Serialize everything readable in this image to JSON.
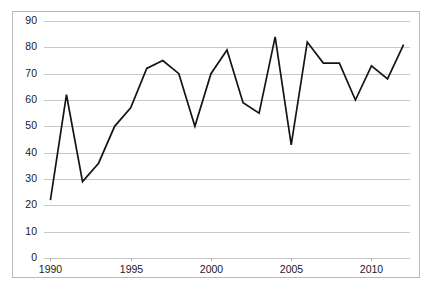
{
  "chart_data": {
    "type": "line",
    "title": "",
    "subtitle": "",
    "xlabel": "",
    "ylabel": "",
    "x": [
      1990,
      1991,
      1992,
      1993,
      1994,
      1995,
      1996,
      1997,
      1998,
      1999,
      2000,
      2001,
      2002,
      2003,
      2004,
      2005,
      2006,
      2007,
      2008,
      2009,
      2010,
      2011,
      2012
    ],
    "values": [
      22,
      62,
      29,
      36,
      50,
      57,
      72,
      75,
      70,
      50,
      70,
      79,
      59,
      55,
      84,
      43,
      82,
      74,
      74,
      60,
      73,
      68,
      81
    ],
    "series": [
      {
        "name": "",
        "values": [
          22,
          62,
          29,
          36,
          50,
          57,
          72,
          75,
          70,
          50,
          70,
          79,
          59,
          55,
          84,
          43,
          82,
          74,
          74,
          60,
          73,
          68,
          81
        ]
      }
    ],
    "xlim": [
      1989.6,
      2012.4
    ],
    "ylim": [
      0,
      90
    ],
    "ytick_labels": [
      "0",
      "10",
      "20",
      "30",
      "40",
      "50",
      "60",
      "70",
      "80",
      "90"
    ],
    "ytick_values": [
      0,
      10,
      20,
      30,
      40,
      50,
      60,
      70,
      80,
      90
    ],
    "xtick_labels": [
      "1990",
      "1995",
      "2000",
      "2005",
      "2010"
    ],
    "xtick_values": [
      1990,
      1995,
      2000,
      2005,
      2010
    ],
    "grid": true,
    "grid_axis": "y",
    "legend": false,
    "legend_position": "none",
    "line_color": "#141414",
    "grid_color": "#c8c8c8",
    "background_color": "#ffffff",
    "border_color": "#b9b9b9",
    "annotations": []
  }
}
